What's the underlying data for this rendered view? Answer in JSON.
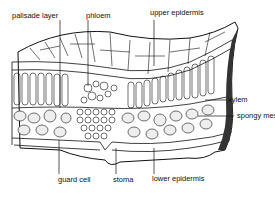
{
  "diagram": {
    "labels": {
      "palisade_layer": "palisade layer",
      "phloem": "phloem",
      "upper_epidermis": "upper epidermis",
      "xylem": "xylem",
      "spongy_mesophyll": "spongy mesophyll",
      "guard_cell": "guard cell",
      "stoma": "stoma",
      "lower_epidermis": "lower epidermis"
    },
    "colors": {
      "ink": "#111111",
      "background": "#ffffff",
      "stipple": "#666666"
    }
  }
}
